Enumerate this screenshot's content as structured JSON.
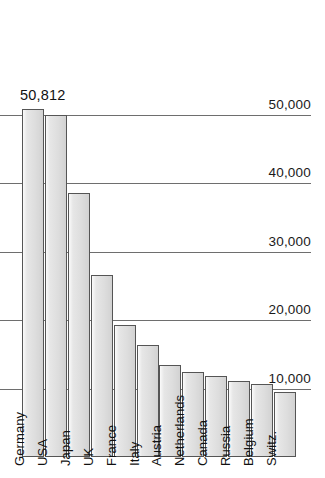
{
  "chart_data": {
    "type": "bar",
    "title": "",
    "subtitle": "",
    "xlabel": "",
    "ylabel": "",
    "categories": [
      "Germany",
      "USA",
      "Japan",
      "UK",
      "France",
      "Italy",
      "Austria",
      "Netherlands",
      "Canada",
      "Russia",
      "Belgium",
      "Switz."
    ],
    "values": [
      50812,
      50000,
      38500,
      26500,
      19200,
      16400,
      13400,
      12400,
      11800,
      11100,
      10600,
      9500
    ],
    "value_labels": [
      "50,812",
      "",
      "",
      "",
      "",
      "",
      "",
      "",
      "",
      "",
      "",
      ""
    ],
    "ylim": [
      0,
      59500
    ],
    "yticks": [
      10000,
      20000,
      30000,
      40000,
      50000
    ],
    "ytick_labels": [
      "10,000",
      "20,000",
      "30,000",
      "40,000",
      "50,000"
    ],
    "grid": true,
    "legend": false,
    "legend_position": "none",
    "bar_fill_color": "#e2e2e2",
    "bar_edge_color": "#555555",
    "gridline_color": "#6e6e6e",
    "background_color": "#ffffff",
    "text_color": "#111111"
  }
}
